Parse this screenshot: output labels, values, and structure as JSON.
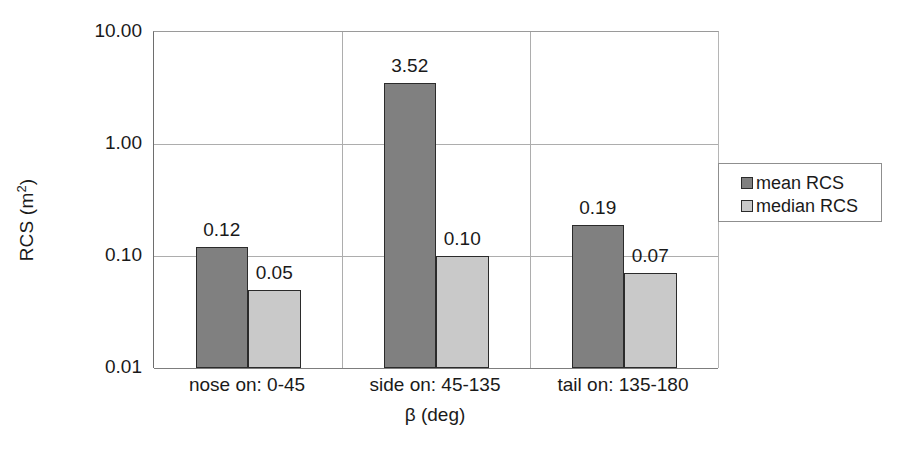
{
  "chart_data": {
    "type": "bar",
    "title": "",
    "xlabel": "β (deg)",
    "ylabel": "RCS (m²)",
    "ylabel_main": "RCS (m",
    "ylabel_sup": "2",
    "ylabel_tail": ")",
    "yscale": "log",
    "ylim": [
      0.01,
      10.0
    ],
    "grid": true,
    "legend_position": "right",
    "categories": [
      "nose on:  0-45",
      "side on: 45-135",
      "tail on: 135-180"
    ],
    "ytick_labels": [
      "10.00",
      "1.00",
      "0.10",
      "0.01"
    ],
    "ytick_values": [
      10.0,
      1.0,
      0.1,
      0.01
    ],
    "series": [
      {
        "name": "mean RCS",
        "color": "#808080",
        "values": [
          0.12,
          3.52,
          0.19
        ],
        "labels": [
          "0.12",
          "3.52",
          "0.19"
        ]
      },
      {
        "name": "median RCS",
        "color": "#c9c9c9",
        "values": [
          0.05,
          0.1,
          0.07
        ],
        "labels": [
          "0.05",
          "0.10",
          "0.07"
        ]
      }
    ]
  },
  "legend": {
    "entries": [
      {
        "label": "mean RCS",
        "color": "#808080"
      },
      {
        "label": "median RCS",
        "color": "#c9c9c9"
      }
    ]
  },
  "axes": {
    "y_title": "RCS (m",
    "y_title_sup": "2",
    "y_title_end": ")",
    "x_title": "β (deg)"
  },
  "colors": {
    "mean_bar": "#808080",
    "median_bar": "#c9c9c9",
    "bar_border": "#2b2b2b",
    "gridline": "#adadad",
    "axis": "#6e6e6e",
    "text": "#1a1a1a",
    "background": "#ffffff"
  }
}
